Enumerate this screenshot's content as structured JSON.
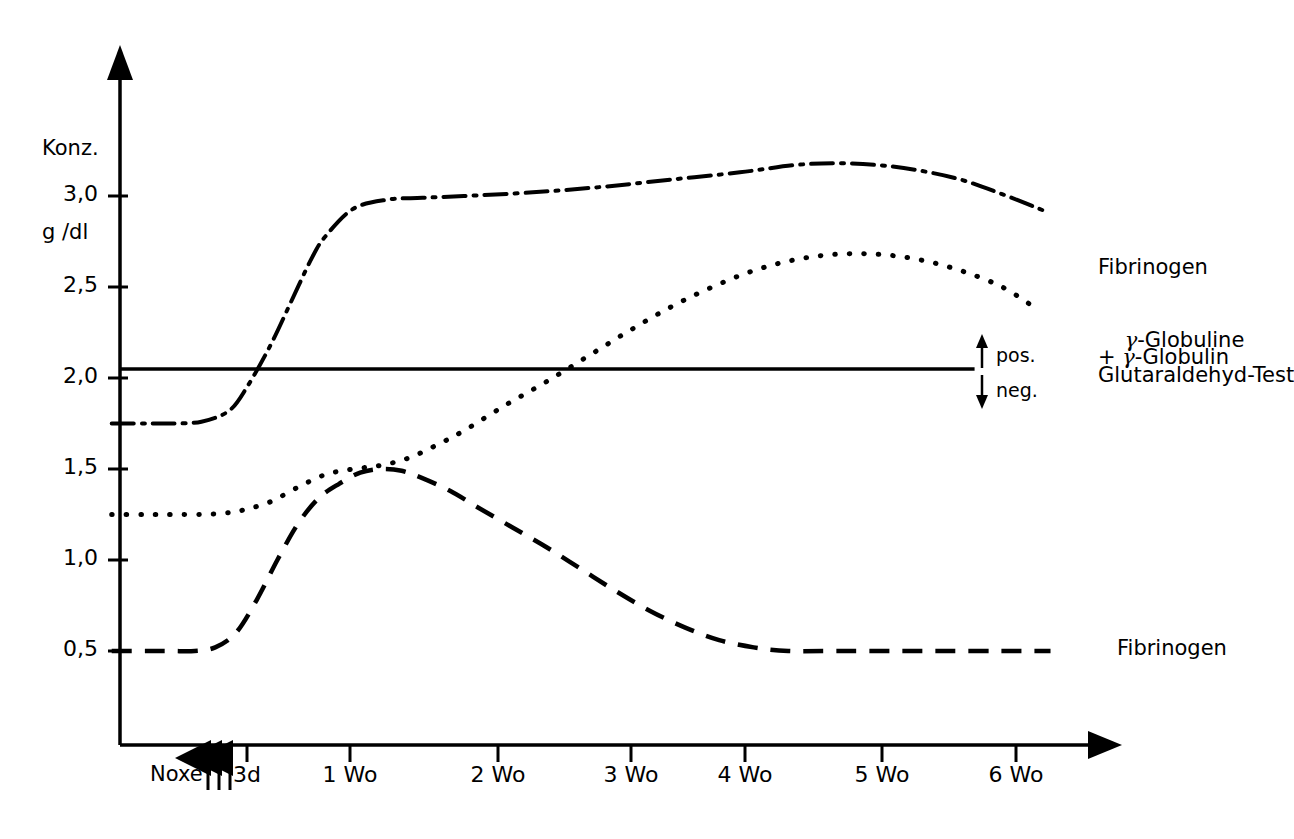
{
  "chart_data": {
    "type": "line",
    "title": "",
    "subtitle": "",
    "xlabel": "",
    "ylabel": "Konz.\ng/dl",
    "ylabel_line1": "Konz.",
    "ylabel_line2": "g/dl",
    "xlim": [
      -0.6,
      6.6
    ],
    "ylim": [
      0.0,
      3.45
    ],
    "grid": false,
    "legend_position": "right-inline-labels",
    "x_unit": "weeks",
    "x_tick_labels": [
      "Noxe",
      "3 d",
      "1 Wo",
      "2 Wo",
      "3 Wo",
      "4 Wo",
      "5 Wo",
      "6 Wo"
    ],
    "x_tick_values": [
      -0.12,
      0.43,
      1.0,
      2.0,
      3.0,
      4.0,
      5.0,
      6.0
    ],
    "x_ticks_drawn": [
      0.43,
      1.0,
      2.0,
      3.0,
      4.0,
      5.0,
      6.0
    ],
    "y_tick_labels": [
      "3,0",
      "2,5",
      "2,0",
      "1,5",
      "1,0",
      "0,5"
    ],
    "y_tick_values": [
      3.0,
      2.5,
      2.0,
      1.5,
      1.0,
      0.5
    ],
    "annotations": {
      "noxe_arrows": 3,
      "noxe_arrow_label": "Noxe",
      "threshold_line_value": 2.05,
      "threshold_pos_label": "pos.",
      "threshold_neg_label": "neg.",
      "threshold_up_arrow": "↑",
      "threshold_down_arrow": "↓"
    },
    "series": [
      {
        "name": "Fibrinogen + γ-Globulin",
        "label_line1": "Fibrinogen",
        "label_line2": "+ γ-Globulin",
        "style": "dash-dot",
        "color": "#000000",
        "x": [
          -0.55,
          -0.3,
          -0.12,
          0.1,
          0.3,
          0.43,
          0.6,
          0.75,
          0.9,
          1.0,
          1.2,
          1.45,
          1.7,
          2.0,
          2.5,
          3.0,
          3.5,
          4.0,
          4.4,
          4.7,
          5.0,
          5.3,
          5.6,
          5.9,
          6.2
        ],
        "y": [
          1.75,
          1.75,
          1.75,
          1.76,
          1.82,
          1.95,
          2.18,
          2.42,
          2.66,
          2.78,
          2.93,
          2.98,
          2.99,
          3.0,
          3.02,
          3.05,
          3.09,
          3.13,
          3.17,
          3.18,
          3.17,
          3.14,
          3.09,
          3.01,
          2.92
        ]
      },
      {
        "name": "γ-Globuline",
        "label_line1": "γ-Globuline",
        "style": "dotted",
        "color": "#000000",
        "x": [
          -0.55,
          -0.3,
          -0.12,
          0.1,
          0.3,
          0.43,
          0.6,
          0.8,
          1.0,
          1.2,
          1.4,
          1.6,
          1.8,
          2.0,
          2.3,
          2.6,
          2.9,
          3.2,
          3.5,
          3.8,
          4.1,
          4.4,
          4.7,
          5.0,
          5.3,
          5.6,
          5.9,
          6.15
        ],
        "y": [
          1.25,
          1.25,
          1.25,
          1.25,
          1.26,
          1.28,
          1.32,
          1.4,
          1.47,
          1.5,
          1.52,
          1.56,
          1.63,
          1.71,
          1.85,
          1.98,
          2.12,
          2.26,
          2.39,
          2.5,
          2.59,
          2.65,
          2.68,
          2.68,
          2.65,
          2.59,
          2.5,
          2.38
        ]
      },
      {
        "name": "Fibrinogen",
        "label_line1": "Fibrinogen",
        "style": "dashed",
        "color": "#000000",
        "x": [
          -0.55,
          -0.3,
          -0.12,
          0.05,
          0.2,
          0.35,
          0.5,
          0.65,
          0.8,
          0.95,
          1.1,
          1.25,
          1.4,
          1.55,
          1.7,
          1.9,
          2.1,
          2.35,
          2.6,
          2.85,
          3.1,
          3.35,
          3.6,
          3.85,
          4.1,
          4.35,
          4.7,
          5.1,
          5.5,
          5.9,
          6.25
        ],
        "y": [
          0.5,
          0.5,
          0.5,
          0.5,
          0.52,
          0.6,
          0.78,
          1.0,
          1.2,
          1.34,
          1.42,
          1.48,
          1.5,
          1.49,
          1.45,
          1.38,
          1.29,
          1.18,
          1.07,
          0.95,
          0.83,
          0.72,
          0.63,
          0.56,
          0.52,
          0.5,
          0.5,
          0.5,
          0.5,
          0.5,
          0.5
        ]
      },
      {
        "name": "Glutaraldehyd-Test",
        "label_line1": "Glutaraldehyd-Test",
        "style": "solid",
        "color": "#000000",
        "x": [
          -0.6,
          5.7
        ],
        "y": [
          2.05,
          2.05
        ],
        "is_threshold": true
      }
    ]
  },
  "labels": {
    "y_axis_title_line1": "Konz.",
    "y_axis_title_line2": "g /dl",
    "series_fibrinogen_gamma_line1": "Fibrinogen",
    "series_fibrinogen_gamma_plus": "+ ",
    "series_fibrinogen_gamma_greek": "γ",
    "series_fibrinogen_gamma_tail": "-Globulin",
    "series_gamma_globuline_greek": "γ",
    "series_gamma_globuline_tail": "-Globuline",
    "series_glutaraldehyd": "Glutaraldehyd-Test",
    "series_fibrinogen": "Fibrinogen",
    "pos_label": "pos.",
    "neg_label": "neg.",
    "noxe_label": "Noxe"
  },
  "ticks": {
    "y": [
      {
        "label": "3,0",
        "value": 3.0
      },
      {
        "label": "2,5",
        "value": 2.5
      },
      {
        "label": "2,0",
        "value": 2.0
      },
      {
        "label": "1,5",
        "value": 1.5
      },
      {
        "label": "1,0",
        "value": 1.0
      },
      {
        "label": "0,5",
        "value": 0.5
      }
    ],
    "x": [
      {
        "label": "3d",
        "value": 0.43
      },
      {
        "label": "1 Wo",
        "value": 1.0
      },
      {
        "label": "2 Wo",
        "value": 2.0
      },
      {
        "label": "3 Wo",
        "value": 3.0
      },
      {
        "label": "4 Wo",
        "value": 4.0
      },
      {
        "label": "5 Wo",
        "value": 5.0
      },
      {
        "label": "6 Wo",
        "value": 6.0
      }
    ]
  },
  "colors": {
    "ink": "#000000",
    "background": "#ffffff"
  }
}
